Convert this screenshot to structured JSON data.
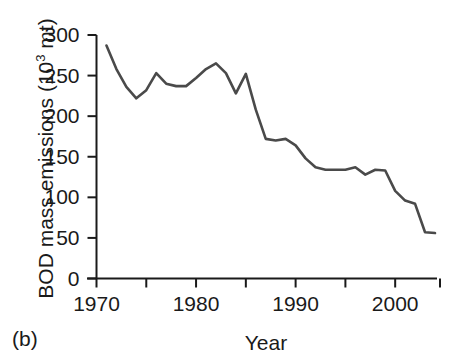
{
  "panel": {
    "label": "(b)"
  },
  "chart_data": {
    "type": "line",
    "title": "",
    "xlabel": "Year",
    "ylabel_plain": "BOD mass emissions (103 mt)",
    "ylabel_main": "BOD mass emissions (10",
    "ylabel_exponent": "3",
    "ylabel_suffix": " mt)",
    "xlim": [
      1970,
      2004
    ],
    "ylim": [
      0,
      300
    ],
    "grid": false,
    "legend": "none",
    "xticks": [
      1970,
      1975,
      1980,
      1985,
      1990,
      1995,
      2000
    ],
    "xtick_labels": [
      "1970",
      "",
      "1980",
      "",
      "1990",
      "",
      "2000"
    ],
    "yticks": [
      0,
      50,
      100,
      150,
      200,
      250,
      300
    ],
    "ytick_labels": [
      "0",
      "50",
      "100",
      "150",
      "200",
      "250",
      "300"
    ],
    "line_color": "#4a4a4a",
    "x": [
      1971,
      1972,
      1973,
      1974,
      1975,
      1976,
      1977,
      1978,
      1979,
      1980,
      1981,
      1982,
      1983,
      1984,
      1985,
      1986,
      1987,
      1988,
      1989,
      1990,
      1991,
      1992,
      1993,
      1994,
      1995,
      1996,
      1997,
      1998,
      1999,
      2000,
      2001,
      2002,
      2003,
      2004
    ],
    "values": [
      287,
      258,
      236,
      222,
      232,
      253,
      240,
      237,
      237,
      247,
      258,
      265,
      253,
      228,
      252,
      208,
      172,
      170,
      172,
      164,
      148,
      137,
      134,
      134,
      134,
      137,
      128,
      134,
      133,
      108,
      96,
      92,
      57,
      56
    ],
    "series": [
      {
        "name": "BOD mass emissions",
        "values": [
          287,
          258,
          236,
          222,
          232,
          253,
          240,
          237,
          237,
          247,
          258,
          265,
          253,
          228,
          252,
          208,
          172,
          170,
          172,
          164,
          148,
          137,
          134,
          134,
          134,
          137,
          128,
          134,
          133,
          108,
          96,
          92,
          57,
          56
        ]
      }
    ]
  },
  "icons": {
    "axis": "axis-icon"
  }
}
